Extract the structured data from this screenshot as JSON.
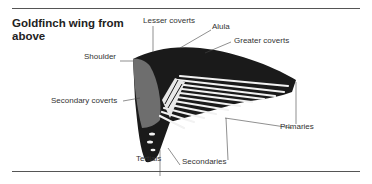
{
  "title": "Goldfinch wing from above",
  "title_line1": "Goldfinch wing from",
  "title_line2": "above",
  "labels": {
    "lesser_coverts": "Lesser coverts",
    "alula": "Alula",
    "greater_coverts": "Greater coverts",
    "shoulder": "Shoulder",
    "secondary_coverts": "Secondary coverts",
    "primaries": "Primaries",
    "tertials": "Tertials",
    "secondaries": "Secondaries"
  },
  "colors": {
    "feather_dark": "#1a1a1a",
    "feather_light": "#f2f2f2",
    "shoulder": "#6e6e6e",
    "rule": "#555555"
  }
}
